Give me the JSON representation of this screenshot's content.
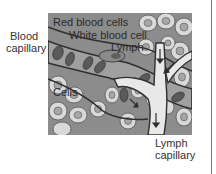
{
  "diagram": {
    "labels": {
      "red_blood_cells": "Red blood cells",
      "white_blood_cell": "White blood cell",
      "lymph": "Lymph",
      "blood_capillary_line1": "Blood",
      "blood_capillary_line2": "capillary",
      "cells": "Cells",
      "lymph_capillary_line1": "Lymph",
      "lymph_capillary_line2": "capillary"
    },
    "colors": {
      "tissue_background": "#8c8c8c",
      "cell_fill": "#d9d9d9",
      "nucleus_fill": "#a6a6a6",
      "capillary_fill": "#a0a0a0",
      "lymph_vessel_fill": "#e8e8e8",
      "red_blood_cell_fill": "#5a5a5a",
      "outline": "#2e2e2e"
    }
  }
}
